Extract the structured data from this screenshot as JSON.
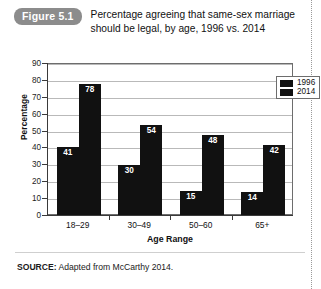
{
  "figure": {
    "badge": "Figure 5.1",
    "title": "Percentage agreeing that same-sex marriage should be legal, by age, 1996 vs. 2014"
  },
  "source": {
    "label": "SOURCE:",
    "text": " Adapted from McCarthy 2014."
  },
  "colors": {
    "bar": "#111111",
    "badge_bg": "#8c8c8c",
    "gridline": "#b9b9b9",
    "axis": "#3a3a3a",
    "frame": "#6d6d6d"
  },
  "chart_data": {
    "type": "bar",
    "title": "Percentage agreeing that same-sex marriage should be legal, by age, 1996 vs. 2014",
    "xlabel": "Age Range",
    "ylabel": "Percentage",
    "categories": [
      "18–29",
      "30–49",
      "50–60",
      "65+"
    ],
    "series": [
      {
        "name": "1996",
        "values": [
          41,
          30,
          15,
          14
        ]
      },
      {
        "name": "2014",
        "values": [
          78,
          54,
          48,
          42
        ]
      }
    ],
    "ylim": [
      0,
      90
    ],
    "yticks": [
      0,
      10,
      20,
      30,
      40,
      50,
      60,
      70,
      80,
      90
    ],
    "ytick_labels": [
      "0",
      "10",
      "20",
      "30",
      "40",
      "50",
      "60",
      "70",
      "80",
      "90"
    ],
    "grid": true,
    "legend_position": "top-right",
    "data_labels": true
  }
}
